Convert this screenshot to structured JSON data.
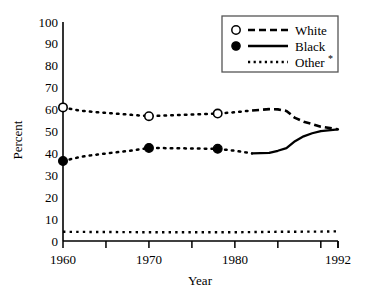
{
  "chart_data": {
    "type": "line",
    "title": "",
    "xlabel": "Year",
    "ylabel": "Percent",
    "xlim": [
      1960,
      1992
    ],
    "ylim": [
      0,
      100
    ],
    "grid": false,
    "legend_position": "top-right",
    "y_ticks": [
      0,
      10,
      20,
      30,
      40,
      50,
      60,
      70,
      80,
      90,
      100
    ],
    "y_tick_labels": [
      "0",
      "10",
      "20",
      "30",
      "40",
      "50",
      "60",
      "70",
      "80",
      "90",
      "100"
    ],
    "x_ticks": [
      1960,
      1965,
      1970,
      1975,
      1980,
      1985,
      1990,
      1992
    ],
    "x_tick_labels_shown": [
      "1960",
      "1970",
      "1980",
      "1992"
    ],
    "x_labeled_ticks": [
      1960,
      1970,
      1980,
      1992
    ],
    "series": [
      {
        "name": "White",
        "style": "dashed",
        "marker": "open-circle",
        "x": [
          1960,
          1962,
          1964,
          1966,
          1968,
          1970,
          1972,
          1974,
          1976,
          1978,
          1980,
          1982,
          1984,
          1985,
          1986,
          1987,
          1988,
          1989,
          1990,
          1992
        ],
        "values": [
          61,
          59.5,
          58.8,
          58.2,
          57.6,
          57,
          57.3,
          57.6,
          57.9,
          58.2,
          58.8,
          59.6,
          60.2,
          60.1,
          59.4,
          56.2,
          54.5,
          53.4,
          52.2,
          51
        ],
        "marker_points": [
          {
            "x": 1960,
            "y": 61
          },
          {
            "x": 1970,
            "y": 57
          },
          {
            "x": 1978,
            "y": 58.2
          }
        ]
      },
      {
        "name": "Black",
        "style": "solid",
        "marker": "filled-circle",
        "x": [
          1960,
          1962,
          1964,
          1966,
          1968,
          1970,
          1972,
          1974,
          1976,
          1978,
          1980,
          1982,
          1984,
          1985,
          1986,
          1987,
          1988,
          1989,
          1990,
          1992
        ],
        "values": [
          36.5,
          38.4,
          39.5,
          40.4,
          41.3,
          42.5,
          42.4,
          42.3,
          42.2,
          42.1,
          41.2,
          40,
          40.2,
          41.2,
          42.4,
          45.6,
          47.8,
          49.2,
          50.2,
          51
        ],
        "marker_points": [
          {
            "x": 1960,
            "y": 36.5
          },
          {
            "x": 1970,
            "y": 42.5
          },
          {
            "x": 1978,
            "y": 42.1
          }
        ]
      },
      {
        "name": "Other *",
        "style": "dotted",
        "marker": "none",
        "x": [
          1960,
          1965,
          1970,
          1975,
          1980,
          1985,
          1990,
          1992
        ],
        "values": [
          4.2,
          4.1,
          4.0,
          4.0,
          4.0,
          4.2,
          4.3,
          4.4
        ],
        "marker_points": []
      }
    ]
  },
  "legend": {
    "items": [
      {
        "label": "White",
        "marker": "open-circle",
        "line": "dashed"
      },
      {
        "label": "Black",
        "marker": "filled-circle",
        "line": "solid"
      },
      {
        "label": "Other",
        "suffix": "*",
        "marker": "none",
        "line": "dotted"
      }
    ]
  },
  "axes": {
    "y_title": "Percent",
    "x_title": "Year",
    "y_labels": [
      "100",
      "90",
      "80",
      "70",
      "60",
      "50",
      "40",
      "30",
      "20",
      "10",
      "0"
    ],
    "x_labels": [
      "1960",
      "1970",
      "1980",
      "1992"
    ]
  },
  "colors": {
    "line": "#000000",
    "axis": "#000000",
    "background": "#ffffff",
    "legend_border": "#555555"
  }
}
